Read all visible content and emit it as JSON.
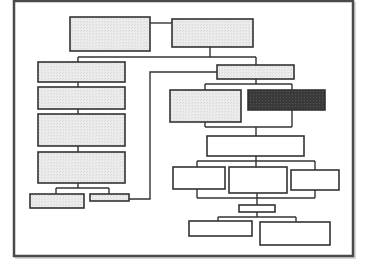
{
  "diagram": {
    "type": "org-chart-flowchart",
    "title": "",
    "labels_visible": false,
    "colors": {
      "background": "#ffffff",
      "frame": "#4a4a4a",
      "frame_shadow": "#d8d8d8",
      "line": "#333333",
      "box_light_fill": "#e8e8e8",
      "box_white_fill": "#ffffff",
      "box_dark_fill": "#3a3a3a"
    },
    "frame": {
      "x": 14,
      "y": 1,
      "w": 339,
      "h": 255
    },
    "nodes": [
      {
        "id": "top-left",
        "x": 70,
        "y": 17,
        "w": 80,
        "h": 34,
        "fill": "light",
        "text": ""
      },
      {
        "id": "top-right",
        "x": 172,
        "y": 19,
        "w": 81,
        "h": 28,
        "fill": "light",
        "text": ""
      },
      {
        "id": "left-1",
        "x": 38,
        "y": 62,
        "w": 87,
        "h": 20,
        "fill": "light",
        "text": ""
      },
      {
        "id": "left-2",
        "x": 38,
        "y": 87,
        "w": 87,
        "h": 22,
        "fill": "light",
        "text": ""
      },
      {
        "id": "left-3",
        "x": 38,
        "y": 114,
        "w": 87,
        "h": 32,
        "fill": "light",
        "text": ""
      },
      {
        "id": "left-4",
        "x": 38,
        "y": 152,
        "w": 87,
        "h": 31,
        "fill": "light",
        "text": ""
      },
      {
        "id": "left-sub-a",
        "x": 30,
        "y": 194,
        "w": 54,
        "h": 14,
        "fill": "light",
        "text": ""
      },
      {
        "id": "left-sub-b",
        "x": 90,
        "y": 194,
        "w": 39,
        "h": 7,
        "fill": "light",
        "text": ""
      },
      {
        "id": "right-head",
        "x": 217,
        "y": 65,
        "w": 77,
        "h": 14,
        "fill": "light",
        "text": ""
      },
      {
        "id": "right-light",
        "x": 170,
        "y": 90,
        "w": 71,
        "h": 32,
        "fill": "light",
        "text": ""
      },
      {
        "id": "right-dark",
        "x": 248,
        "y": 90,
        "w": 77,
        "h": 20,
        "fill": "dark",
        "text": ""
      },
      {
        "id": "wide",
        "x": 207,
        "y": 136,
        "w": 97,
        "h": 20,
        "fill": "white",
        "text": ""
      },
      {
        "id": "row-a",
        "x": 173,
        "y": 167,
        "w": 52,
        "h": 22,
        "fill": "white",
        "text": ""
      },
      {
        "id": "row-b",
        "x": 229,
        "y": 167,
        "w": 58,
        "h": 26,
        "fill": "white",
        "text": ""
      },
      {
        "id": "row-c",
        "x": 291,
        "y": 170,
        "w": 48,
        "h": 20,
        "fill": "white",
        "text": ""
      },
      {
        "id": "small",
        "x": 239,
        "y": 205,
        "w": 36,
        "h": 7,
        "fill": "white",
        "text": ""
      },
      {
        "id": "bottom-a",
        "x": 189,
        "y": 221,
        "w": 63,
        "h": 15,
        "fill": "white",
        "text": ""
      },
      {
        "id": "bottom-b",
        "x": 260,
        "y": 222,
        "w": 70,
        "h": 23,
        "fill": "white",
        "text": ""
      }
    ],
    "edges": [
      {
        "points": [
          [
            150,
            23
          ],
          [
            172,
            23
          ]
        ]
      },
      {
        "points": [
          [
            210,
            47
          ],
          [
            210,
            57
          ]
        ]
      },
      {
        "points": [
          [
            78,
            57
          ],
          [
            256,
            57
          ]
        ]
      },
      {
        "points": [
          [
            78,
            57
          ],
          [
            78,
            62
          ]
        ]
      },
      {
        "points": [
          [
            256,
            57
          ],
          [
            256,
            65
          ]
        ]
      },
      {
        "points": [
          [
            78,
            82
          ],
          [
            78,
            87
          ]
        ]
      },
      {
        "points": [
          [
            78,
            109
          ],
          [
            78,
            114
          ]
        ]
      },
      {
        "points": [
          [
            78,
            146
          ],
          [
            78,
            152
          ]
        ]
      },
      {
        "points": [
          [
            78,
            183
          ],
          [
            78,
            188
          ]
        ]
      },
      {
        "points": [
          [
            56,
            188
          ],
          [
            109,
            188
          ]
        ]
      },
      {
        "points": [
          [
            56,
            188
          ],
          [
            56,
            194
          ]
        ]
      },
      {
        "points": [
          [
            109,
            188
          ],
          [
            109,
            194
          ]
        ]
      },
      {
        "points": [
          [
            129,
            199
          ],
          [
            150,
            199
          ],
          [
            150,
            72
          ],
          [
            217,
            72
          ]
        ]
      },
      {
        "points": [
          [
            256,
            79
          ],
          [
            256,
            84
          ]
        ]
      },
      {
        "points": [
          [
            205,
            84
          ],
          [
            292,
            84
          ]
        ]
      },
      {
        "points": [
          [
            205,
            84
          ],
          [
            205,
            90
          ]
        ]
      },
      {
        "points": [
          [
            292,
            84
          ],
          [
            292,
            90
          ]
        ]
      },
      {
        "points": [
          [
            205,
            122
          ],
          [
            205,
            127
          ]
        ]
      },
      {
        "points": [
          [
            292,
            110
          ],
          [
            292,
            127
          ]
        ]
      },
      {
        "points": [
          [
            205,
            127
          ],
          [
            292,
            127
          ]
        ]
      },
      {
        "points": [
          [
            256,
            127
          ],
          [
            256,
            136
          ]
        ]
      },
      {
        "points": [
          [
            256,
            156
          ],
          [
            256,
            161
          ]
        ]
      },
      {
        "points": [
          [
            197,
            161
          ],
          [
            315,
            161
          ]
        ]
      },
      {
        "points": [
          [
            197,
            161
          ],
          [
            197,
            167
          ]
        ]
      },
      {
        "points": [
          [
            256,
            161
          ],
          [
            256,
            167
          ]
        ]
      },
      {
        "points": [
          [
            315,
            161
          ],
          [
            315,
            170
          ]
        ]
      },
      {
        "points": [
          [
            197,
            189
          ],
          [
            197,
            198
          ]
        ]
      },
      {
        "points": [
          [
            315,
            190
          ],
          [
            315,
            198
          ]
        ]
      },
      {
        "points": [
          [
            197,
            198
          ],
          [
            315,
            198
          ]
        ]
      },
      {
        "points": [
          [
            257,
            193
          ],
          [
            257,
            205
          ]
        ]
      },
      {
        "points": [
          [
            257,
            212
          ],
          [
            257,
            217
          ]
        ]
      },
      {
        "points": [
          [
            218,
            217
          ],
          [
            296,
            217
          ]
        ]
      },
      {
        "points": [
          [
            218,
            217
          ],
          [
            218,
            221
          ]
        ]
      },
      {
        "points": [
          [
            296,
            217
          ],
          [
            296,
            222
          ]
        ]
      }
    ]
  }
}
